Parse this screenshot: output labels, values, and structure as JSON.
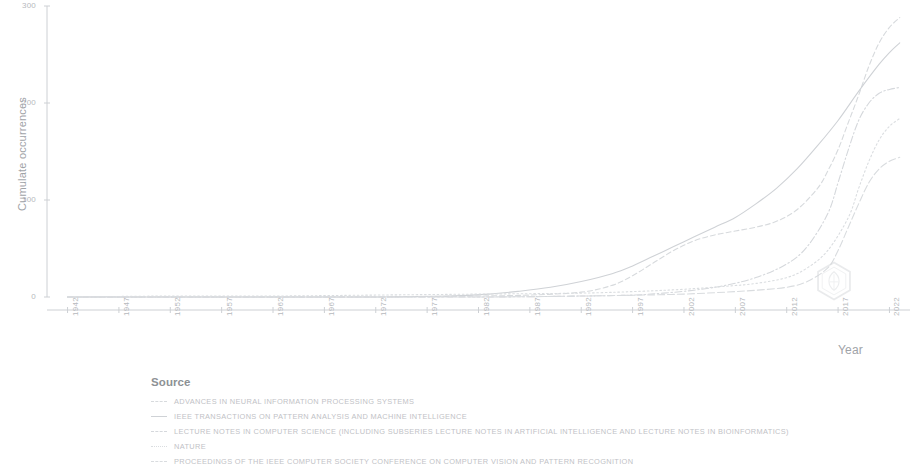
{
  "chart_data": {
    "type": "line",
    "title": "",
    "xlabel": "Year",
    "ylabel": "Cumulate occurrences",
    "xlim": [
      1940,
      2024
    ],
    "ylim": [
      0,
      300
    ],
    "grid": false,
    "legend_position": "below",
    "legend_title": "Source",
    "ytick_labels": [
      "0",
      "100",
      "200",
      "300"
    ],
    "ytick_values": [
      0,
      100,
      200,
      300
    ],
    "xtick_labels": [
      "1942",
      "1947",
      "1952",
      "1957",
      "1962",
      "1967",
      "1972",
      "1977",
      "1982",
      "1987",
      "1992",
      "1997",
      "2002",
      "2007",
      "2012",
      "2017",
      "2022"
    ],
    "xtick_values": [
      1942,
      1947,
      1952,
      1957,
      1962,
      1967,
      1972,
      1977,
      1982,
      1987,
      1992,
      1997,
      2002,
      2007,
      2012,
      2017,
      2022
    ],
    "series": [
      {
        "name": "ADVANCES IN NEURAL INFORMATION PROCESSING SYSTEMS",
        "color": "#d7dadd",
        "dash": "dashed",
        "x": [
          1942,
          1952,
          1962,
          1972,
          1982,
          1987,
          1992,
          1995,
          1997,
          1999,
          2001,
          2003,
          2005,
          2007,
          2009,
          2011,
          2013,
          2015,
          2016,
          2017,
          2018,
          2019,
          2020,
          2021,
          2022,
          2023
        ],
        "y": [
          0,
          0,
          0,
          0,
          1,
          2,
          5,
          12,
          22,
          35,
          48,
          58,
          64,
          68,
          72,
          78,
          90,
          112,
          130,
          152,
          180,
          208,
          238,
          262,
          278,
          288
        ]
      },
      {
        "name": "IEEE TRANSACTIONS ON PATTERN ANALYSIS AND MACHINE INTELLIGENCE",
        "color": "#cfd2d6",
        "dash": "solid",
        "x": [
          1942,
          1952,
          1962,
          1972,
          1979,
          1983,
          1986,
          1989,
          1992,
          1995,
          1997,
          1999,
          2001,
          2003,
          2005,
          2007,
          2009,
          2011,
          2013,
          2015,
          2017,
          2019,
          2021,
          2022,
          2023
        ],
        "y": [
          0,
          0,
          0,
          0,
          1,
          3,
          6,
          10,
          16,
          24,
          32,
          42,
          52,
          62,
          72,
          82,
          96,
          112,
          132,
          156,
          182,
          212,
          240,
          252,
          262
        ]
      },
      {
        "name": "LECTURE NOTES IN COMPUTER SCIENCE (INCLUDING SUBSERIES LECTURE NOTES IN ARTIFICIAL INTELLIGENCE AND LECTURE NOTES IN BIOINFORMATICS)",
        "color": "#d5d8dc",
        "dash": "dashdot",
        "x": [
          1942,
          1962,
          1982,
          1992,
          1997,
          2000,
          2003,
          2006,
          2009,
          2012,
          2014,
          2016,
          2017,
          2018,
          2019,
          2020,
          2021,
          2022,
          2023
        ],
        "y": [
          0,
          0,
          0,
          1,
          2,
          4,
          7,
          12,
          20,
          34,
          52,
          86,
          118,
          152,
          182,
          200,
          210,
          214,
          216
        ]
      },
      {
        "name": "NATURE",
        "color": "#dadde0",
        "dash": "dotted",
        "x": [
          1942,
          1952,
          1962,
          1972,
          1982,
          1992,
          1998,
          2002,
          2006,
          2009,
          2012,
          2014,
          2016,
          2018,
          2019,
          2020,
          2021,
          2022,
          2023
        ],
        "y": [
          0,
          1,
          1,
          2,
          3,
          4,
          6,
          8,
          11,
          14,
          20,
          30,
          48,
          82,
          112,
          140,
          162,
          176,
          184
        ]
      },
      {
        "name": "PROCEEDINGS OF THE IEEE COMPUTER SOCIETY CONFERENCE ON COMPUTER VISION AND PATTERN RECOGNITION",
        "color": "#d9dcdf",
        "dash": "dashed2",
        "x": [
          1942,
          1962,
          1982,
          1992,
          1998,
          2002,
          2006,
          2009,
          2012,
          2014,
          2016,
          2017,
          2018,
          2019,
          2020,
          2021,
          2022,
          2023
        ],
        "y": [
          0,
          0,
          0,
          1,
          2,
          3,
          5,
          7,
          10,
          16,
          30,
          48,
          72,
          96,
          118,
          132,
          140,
          144
        ]
      }
    ]
  },
  "axis": {
    "y_label": "Cumulate occurrences",
    "x_label": "Year"
  },
  "legend": {
    "title": "Source",
    "entries": [
      {
        "label": "ADVANCES IN NEURAL INFORMATION PROCESSING SYSTEMS",
        "color": "#d7dadd",
        "dash": "dashed"
      },
      {
        "label": "IEEE TRANSACTIONS ON PATTERN ANALYSIS AND MACHINE INTELLIGENCE",
        "color": "#cfd2d6",
        "dash": "solid"
      },
      {
        "label": "LECTURE NOTES IN COMPUTER SCIENCE (INCLUDING SUBSERIES LECTURE NOTES IN ARTIFICIAL INTELLIGENCE AND LECTURE NOTES IN BIOINFORMATICS)",
        "color": "#d5d8dc",
        "dash": "dashdot"
      },
      {
        "label": "NATURE",
        "color": "#dadde0",
        "dash": "dotted"
      },
      {
        "label": "PROCEEDINGS OF THE IEEE COMPUTER SOCIETY CONFERENCE ON COMPUTER VISION AND PATTERN RECOGNITION",
        "color": "#d9dcdf",
        "dash": "dashed2"
      }
    ]
  },
  "watermark": {
    "name": "hexagon-shield-logo",
    "color": "#d9dcdf"
  },
  "colors": {
    "axis": "#cdd0d4",
    "tick_text": "#b6b9bd",
    "label_text": "#9fa3a8",
    "legend_title": "#8d9195",
    "background": "#ffffff"
  }
}
